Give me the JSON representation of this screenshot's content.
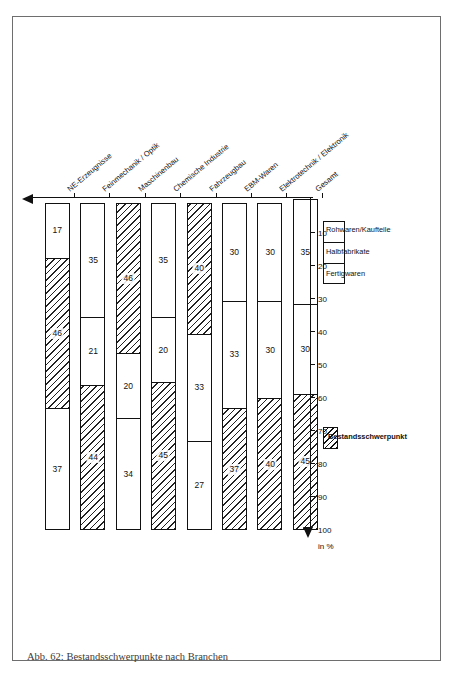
{
  "figure": {
    "caption": "Abb. 62: Bestandsschwerpunkte nach Branchen",
    "axis_unit": "in %"
  },
  "legend": {
    "focus_label": "Bestandsschwerpunkt",
    "items": [
      {
        "label": "Fertigwaren",
        "key": "fertigwaren"
      },
      {
        "label": "Halbfabrikate",
        "key": "halbfabrikate"
      },
      {
        "label": "Rohwaren/Kaufteile",
        "key": "rohwaren-kaufteile"
      }
    ]
  },
  "chart_data": {
    "type": "bar",
    "orientation": "horizontal-stacked",
    "title": "",
    "xlabel": "in %",
    "ylabel": "",
    "xlim": [
      0,
      100
    ],
    "xticks": [
      100,
      90,
      80,
      70,
      60,
      50,
      40,
      30,
      20,
      10
    ],
    "x_axis_direction": "right-to-left",
    "grid": false,
    "legend_position": "left",
    "stack_order": [
      "Fertigwaren",
      "Halbfabrikate",
      "Rohwaren/Kaufteile"
    ],
    "categories": [
      "NE-Erzeugnisse",
      "Feinmechanik / Optik",
      "Maschinenbau",
      "Chemische Industrie",
      "Fahrzeugbau",
      "EBM-Waren",
      "Elektrotechnik / Elektronik",
      "Gesamt"
    ],
    "series": [
      {
        "name": "Fertigwaren",
        "values": [
          37,
          44,
          34,
          45,
          27,
          37,
          40,
          45
        ]
      },
      {
        "name": "Halbfabrikate",
        "values": [
          46,
          21,
          20,
          20,
          33,
          33,
          30,
          30
        ]
      },
      {
        "name": "Rohwaren/Kaufteile",
        "values": [
          17,
          35,
          46,
          35,
          40,
          30,
          30,
          35
        ]
      }
    ],
    "highlighted_segment_per_category": [
      "Halbfabrikate",
      "Fertigwaren",
      "Rohwaren/Kaufteile",
      "Fertigwaren",
      "Rohwaren/Kaufteile",
      "Fertigwaren",
      "Fertigwaren",
      "Fertigwaren"
    ]
  }
}
